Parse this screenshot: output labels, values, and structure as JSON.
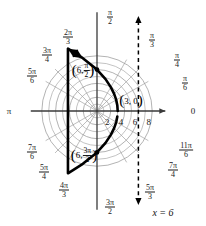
{
  "figure": {
    "title": "",
    "pole_label": "0",
    "directrix_label": "x = 6"
  },
  "chart_data": {
    "type": "line",
    "coordinate_system": "polar",
    "title": "",
    "xlabel": "",
    "ylabel": "",
    "equation_described": "r = 6/(1 + cos(theta))",
    "conic": "parabola",
    "grid": true,
    "radial_ticks": [
      {
        "value": 2,
        "label": "2"
      },
      {
        "value": 4,
        "label": "4"
      },
      {
        "value": 6,
        "label": "6"
      },
      {
        "value": 8,
        "label": "8"
      }
    ],
    "radial_max": 9,
    "angle_labels": [
      {
        "deg": 0,
        "num": "0",
        "den": "",
        "plain": "0"
      },
      {
        "deg": 30,
        "num": "π",
        "den": "6"
      },
      {
        "deg": 45,
        "num": "π",
        "den": "4"
      },
      {
        "deg": 60,
        "num": "π",
        "den": "3"
      },
      {
        "deg": 90,
        "num": "π",
        "den": "2"
      },
      {
        "deg": 120,
        "num": "2π",
        "den": "3"
      },
      {
        "deg": 135,
        "num": "3π",
        "den": "4"
      },
      {
        "deg": 150,
        "num": "5π",
        "den": "6"
      },
      {
        "deg": 180,
        "num": "π",
        "den": "",
        "plain": "π"
      },
      {
        "deg": 210,
        "num": "7π",
        "den": "6"
      },
      {
        "deg": 225,
        "num": "5π",
        "den": "4"
      },
      {
        "deg": 240,
        "num": "4π",
        "den": "3"
      },
      {
        "deg": 270,
        "num": "3π",
        "den": "2"
      },
      {
        "deg": 300,
        "num": "5π",
        "den": "3"
      },
      {
        "deg": 315,
        "num": "7π",
        "den": "4"
      },
      {
        "deg": 330,
        "num": "11π",
        "den": "6"
      }
    ],
    "annotations": [
      {
        "name": "vertex-point",
        "r": 3,
        "theta_deg": 0,
        "text": "(3, 0)",
        "open_paren": "(",
        "body": "3, 0",
        "close_paren": ")"
      },
      {
        "name": "upper-latus-point",
        "r": 6,
        "theta_deg": 90,
        "text": "(6, π/2)",
        "open_paren": "(",
        "r_text": "6,",
        "num": "π",
        "den": "2",
        "close_paren": ")"
      },
      {
        "name": "lower-latus-point",
        "r": 6,
        "theta_deg": 270,
        "text": "(6, 3π/2)",
        "open_paren": "(",
        "r_text": "6,",
        "num": "3π",
        "den": "2",
        "close_paren": ")"
      }
    ],
    "directrix": {
      "type": "vertical-dashed-line",
      "x": 6,
      "label": "x = 6"
    },
    "series": [
      {
        "name": "parabola r = 6/(1+cos theta)",
        "style": "thick-solid-black",
        "arrow_start": true,
        "arrow_end": true,
        "points_polar": [
          {
            "theta_deg": 0,
            "r": 3.0
          },
          {
            "theta_deg": 15,
            "r": 3.05
          },
          {
            "theta_deg": 30,
            "r": 3.22
          },
          {
            "theta_deg": 45,
            "r": 3.51
          },
          {
            "theta_deg": 60,
            "r": 4.0
          },
          {
            "theta_deg": 75,
            "r": 4.78
          },
          {
            "theta_deg": 90,
            "r": 6.0
          },
          {
            "theta_deg": 105,
            "r": 7.93
          },
          {
            "theta_deg": 115,
            "r": 9.96
          },
          {
            "theta_deg": 245,
            "r": 9.96
          },
          {
            "theta_deg": 255,
            "r": 7.93
          },
          {
            "theta_deg": 270,
            "r": 6.0
          },
          {
            "theta_deg": 285,
            "r": 4.78
          },
          {
            "theta_deg": 300,
            "r": 4.0
          },
          {
            "theta_deg": 315,
            "r": 3.51
          },
          {
            "theta_deg": 330,
            "r": 3.22
          },
          {
            "theta_deg": 345,
            "r": 3.05
          }
        ]
      }
    ],
    "markers": [
      {
        "r": 6,
        "theta_deg": 90
      },
      {
        "r": 6,
        "theta_deg": 270
      }
    ],
    "colors": {
      "grid": "#9a9a9a",
      "axis": "#3a3a3a",
      "curve": "#000000",
      "directrix": "#000000",
      "text": "#1a1a1a",
      "background": "#ffffff"
    }
  }
}
